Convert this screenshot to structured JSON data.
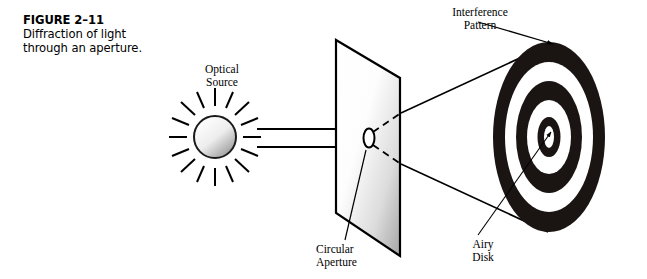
{
  "figure": {
    "number_label": "FIGURE 2–11",
    "caption": "Diffraction of light through an aperture."
  },
  "labels": {
    "optical_source": "Optical\nSource",
    "interference_pattern": "Interference\nPattern",
    "circular_aperture": "Circular\nAperture",
    "airy_disk": "Airy\nDisk"
  },
  "colors": {
    "ink": "#000000",
    "background": "#ffffff",
    "ring_dark": "#1a1413",
    "ring_light": "#ffffff",
    "plane_light": "#ffffff",
    "plane_shade": "#a8a8a8",
    "source_fill_light": "#f2f2f2",
    "source_fill_dark": "#9d9d9d"
  },
  "diagram": {
    "type": "optics-schematic",
    "source_icon": "sun-ray-source",
    "source_ray_count": 16,
    "incident_arrow_count": 2,
    "aperture_shape": "ellipse",
    "aperture_plane_shape": "parallelogram",
    "screen_ring_count": 3,
    "screen_pattern": "concentric-ellipse-rings"
  }
}
